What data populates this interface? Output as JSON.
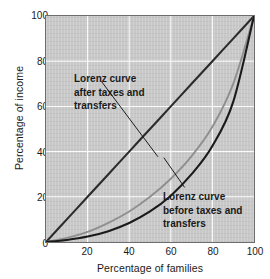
{
  "chart_data": {
    "type": "line",
    "title": "",
    "xlabel": "Percentage of families",
    "ylabel": "Percentage of income",
    "xlim": [
      0,
      100
    ],
    "ylim": [
      0,
      100
    ],
    "xticks": [
      20,
      40,
      60,
      80,
      100
    ],
    "yticks": [
      0,
      20,
      40,
      60,
      80,
      100
    ],
    "grid": true,
    "grid_color": "#ffffff",
    "plot_background": "#c8c8c8",
    "legend_position": "inline-annotations",
    "series": [
      {
        "name": "Line of equality",
        "color": "#2b2b2b",
        "x": [
          0,
          10,
          20,
          30,
          40,
          50,
          60,
          70,
          80,
          90,
          100
        ],
        "y": [
          0,
          10,
          20,
          30,
          40,
          50,
          60,
          70,
          80,
          90,
          100
        ]
      },
      {
        "name": "Lorenz curve after taxes and transfers",
        "color": "#8f8f8f",
        "x": [
          0,
          10,
          20,
          30,
          40,
          50,
          60,
          70,
          80,
          90,
          100
        ],
        "y": [
          0,
          1.8,
          4.5,
          8.5,
          13.5,
          20,
          28,
          38,
          51,
          70,
          100
        ]
      },
      {
        "name": "Lorenz curve before taxes and transfers",
        "color": "#1a1a1a",
        "x": [
          0,
          10,
          20,
          30,
          40,
          50,
          60,
          70,
          80,
          90,
          100
        ],
        "y": [
          0,
          0.9,
          2.4,
          4.8,
          8.4,
          13.5,
          20.5,
          30,
          42.5,
          62,
          100
        ]
      }
    ],
    "annotations": [
      {
        "name": "after-taxes-label",
        "lines": [
          "Lorenz curve",
          "after taxes and",
          "transfers"
        ],
        "points_to_series": "Lorenz curve after taxes and transfers"
      },
      {
        "name": "before-taxes-label",
        "lines": [
          "Lorenz curve",
          "before taxes and",
          "transfers"
        ],
        "points_to_series": "Lorenz curve before taxes and transfers"
      }
    ]
  },
  "axes": {
    "y_title": "Percentage of income",
    "x_title": "Percentage of families",
    "y_ticks": [
      "0",
      "20",
      "40",
      "60",
      "80",
      "100"
    ],
    "x_ticks": [
      "20",
      "40",
      "60",
      "80",
      "100"
    ]
  },
  "annotations": {
    "after": {
      "line1": "Lorenz curve",
      "line2": "after taxes and",
      "line3": "transfers"
    },
    "before": {
      "line1": "Lorenz curve",
      "line2": "before taxes and",
      "line3": "transfers"
    }
  }
}
